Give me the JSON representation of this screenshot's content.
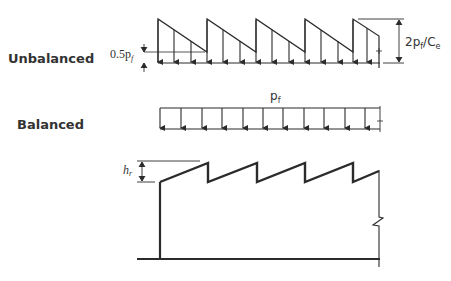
{
  "diagram": {
    "colors": {
      "line": "#2b2b2b",
      "text": "#333333",
      "background": "#ffffff"
    },
    "unbalanced": {
      "label": "Unbalanced",
      "dim_left": "0.5p",
      "dim_left_sub": "f",
      "dim_right_main": "2p",
      "dim_right_sub": "f",
      "dim_right_rest": "/C",
      "dim_right_sub2": "e"
    },
    "balanced": {
      "label": "Balanced",
      "load": "p",
      "load_sub": "f"
    },
    "roof": {
      "height_label": "h",
      "height_sub": "r"
    }
  }
}
